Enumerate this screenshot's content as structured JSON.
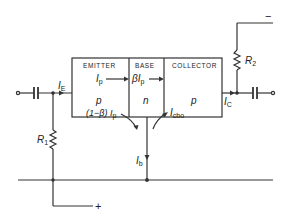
{
  "diagram": {
    "type": "transistor-circuit",
    "regions": [
      {
        "name": "emitter",
        "label": "EMITTER",
        "doping": "p",
        "current_in": "I",
        "current_in_sub": "p",
        "recomb": "(1−β) I",
        "recomb_sub": "p"
      },
      {
        "name": "base",
        "label": "BASE",
        "doping": "n",
        "current": "βI",
        "current_sub": "p"
      },
      {
        "name": "collector",
        "label": "COLLECTOR",
        "doping": "p",
        "leak": "I",
        "leak_sub": "cbo"
      }
    ],
    "currents": {
      "emitter": {
        "main": "I",
        "sub": "E"
      },
      "collector": {
        "main": "I",
        "sub": "C"
      },
      "base": {
        "main": "I",
        "sub": "b"
      }
    },
    "resistors": [
      {
        "name": "R1",
        "main": "R",
        "sub": "1"
      },
      {
        "name": "R2",
        "main": "R",
        "sub": "2"
      }
    ],
    "supply": {
      "positive": "+",
      "negative": "−"
    },
    "colors": {
      "line": "#333333",
      "background": "#ffffff"
    }
  }
}
